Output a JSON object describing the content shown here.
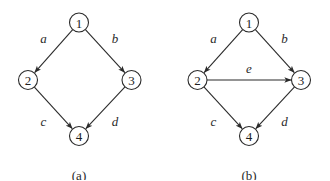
{
  "diagrams": [
    {
      "id": "a",
      "caption": "(a)",
      "nodes": [
        {
          "id": "1",
          "label": "1",
          "x": 79,
          "y": 22.5
        },
        {
          "id": "2",
          "label": "2",
          "x": 28,
          "y": 80
        },
        {
          "id": "3",
          "label": "3",
          "x": 131.5,
          "y": 80
        },
        {
          "id": "4",
          "label": "4",
          "x": 79,
          "y": 136
        }
      ],
      "edges": [
        {
          "from": "1",
          "to": "2",
          "label": "a",
          "lx": 43.5,
          "ly": 38.5
        },
        {
          "from": "1",
          "to": "3",
          "label": "b",
          "lx": 115,
          "ly": 38.5
        },
        {
          "from": "2",
          "to": "4",
          "label": "c",
          "lx": 43.5,
          "ly": 121
        },
        {
          "from": "3",
          "to": "4",
          "label": "d",
          "lx": 115,
          "ly": 121
        }
      ],
      "caption_pos": {
        "x": 79,
        "y": 175
      }
    },
    {
      "id": "b",
      "caption": "(b)",
      "nodes": [
        {
          "id": "1",
          "label": "1",
          "x": 249,
          "y": 22.5
        },
        {
          "id": "2",
          "label": "2",
          "x": 197.5,
          "y": 80
        },
        {
          "id": "3",
          "label": "3",
          "x": 301,
          "y": 80
        },
        {
          "id": "4",
          "label": "4",
          "x": 249,
          "y": 136
        }
      ],
      "edges": [
        {
          "from": "1",
          "to": "2",
          "label": "a",
          "lx": 213.5,
          "ly": 38.5
        },
        {
          "from": "1",
          "to": "3",
          "label": "b",
          "lx": 284.5,
          "ly": 38.5
        },
        {
          "from": "2",
          "to": "3",
          "label": "e",
          "lx": 249,
          "ly": 68
        },
        {
          "from": "2",
          "to": "4",
          "label": "c",
          "lx": 213.5,
          "ly": 121
        },
        {
          "from": "3",
          "to": "4",
          "label": "d",
          "lx": 284.5,
          "ly": 121
        }
      ],
      "caption_pos": {
        "x": 249,
        "y": 175
      }
    }
  ],
  "style": {
    "node_radius": 9.5,
    "stroke_color": "#2a2a2a",
    "background": "#ffffff"
  }
}
